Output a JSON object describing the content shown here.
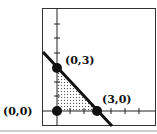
{
  "diagram": {
    "type": "linear-inequality-feasible-region",
    "line": "x + y = 3",
    "points": [
      {
        "label": "(0,3)",
        "x": 0,
        "y": 3
      },
      {
        "label": "(0,0)",
        "x": 0,
        "y": 0
      },
      {
        "label": "(3,0)",
        "x": 3,
        "y": 0
      }
    ],
    "shaded_region": "triangle (0,0)-(0,3)-(3,0), dotted",
    "colors": {
      "ink": "#111111",
      "frame": "#333333",
      "bottom_rule": "#cccccc"
    }
  },
  "labels": {
    "p03": "(0,3)",
    "p00": "(0,0)",
    "p30": "(3,0)"
  }
}
